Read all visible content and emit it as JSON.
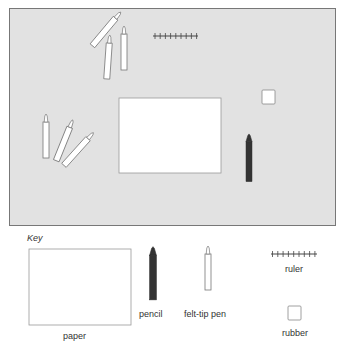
{
  "diagram": {
    "desk": {
      "items": [
        {
          "type": "felt-tip pen",
          "x": 112,
          "y": 30,
          "angle": 40
        },
        {
          "type": "felt-tip pen",
          "x": 108,
          "y": 57,
          "angle": 5
        },
        {
          "type": "felt-tip pen",
          "x": 124,
          "y": 50,
          "angle": 0
        },
        {
          "type": "ruler",
          "x": 153,
          "y": 36
        },
        {
          "type": "rubber",
          "x": 262,
          "y": 90
        },
        {
          "type": "paper",
          "x": 119,
          "y": 98
        },
        {
          "type": "pencil",
          "x": 249,
          "y": 160
        },
        {
          "type": "felt-tip pen",
          "x": 47,
          "y": 138,
          "angle": 0
        },
        {
          "type": "felt-tip pen",
          "x": 63,
          "y": 143,
          "angle": 22
        },
        {
          "type": "felt-tip pen",
          "x": 76,
          "y": 152,
          "angle": 40
        }
      ]
    },
    "key": {
      "title": "Key",
      "entries": [
        {
          "name": "paper",
          "label": "paper"
        },
        {
          "name": "pencil",
          "label": "pencil"
        },
        {
          "name": "felt-tip-pen",
          "label": "felt-tip pen"
        },
        {
          "name": "ruler",
          "label": "ruler"
        },
        {
          "name": "rubber",
          "label": "rubber"
        }
      ]
    },
    "colors": {
      "pencil": "#333333",
      "outline": "#777777",
      "desk_background": "#e2e2e2"
    }
  }
}
